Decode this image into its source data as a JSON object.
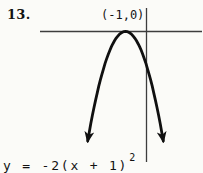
{
  "figure": {
    "problem_number": "13.",
    "vertex_label": "(-1,0)",
    "equation_base": "y = -2(x + 1)",
    "equation_exponent": "2"
  },
  "chart_data": {
    "type": "line",
    "title": "",
    "equation": "y = -2(x + 1)^2",
    "coefficient_a": -2,
    "vertex": [
      -1,
      0
    ],
    "opens": "downward",
    "x_intercept": [
      -1,
      0
    ],
    "x": [
      -3,
      -2.5,
      -2,
      -1.5,
      -1,
      -0.5,
      0,
      0.5,
      1
    ],
    "y": [
      -8,
      -4.5,
      -2,
      -0.5,
      0,
      -0.5,
      -2,
      -4.5,
      -8
    ],
    "xlabel": "",
    "ylabel": "",
    "grid": false,
    "axis_ticks": false,
    "legend": false,
    "annotations": [
      "(-1,0)"
    ]
  },
  "colors": {
    "ink": "#101010",
    "axis": "#3d3d3d",
    "paper": "#fbfbf8"
  }
}
